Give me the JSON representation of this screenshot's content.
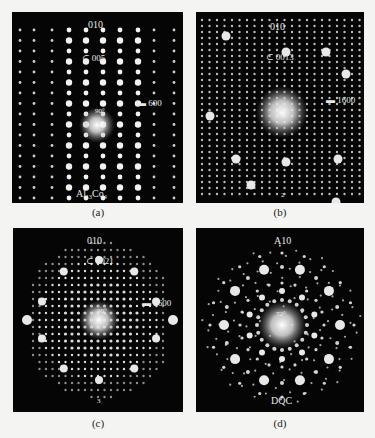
{
  "figure": {
    "panels": [
      {
        "id": "a",
        "caption": "(a)",
        "zone_axis": "010",
        "phase_label": "Al13Co4",
        "phase_main": "Al",
        "phase_sub1": "13",
        "phase_mid": "Co",
        "phase_sub2": "4",
        "reflection_top": "005",
        "reflection_right": "600",
        "angle_label": "90°",
        "pattern": "vertical-rows"
      },
      {
        "id": "b",
        "caption": "(b)",
        "zone_axis": "010",
        "reflection_top": "0013",
        "reflection_right": "1600",
        "angle_label": "90°",
        "bottom_mark": "2",
        "pattern": "dense-rectangular"
      },
      {
        "id": "c",
        "caption": "(c)",
        "zone_axis": "010",
        "reflection_top": "0021",
        "reflection_right": "2600",
        "angle_label": "90°",
        "bottom_mark": "3",
        "pattern": "pseudo-decagonal"
      },
      {
        "id": "d",
        "caption": "(d)",
        "zone_axis": "A10",
        "phase_label": "DQC",
        "angle_label": "72°",
        "pattern": "decagonal"
      }
    ],
    "colors": {
      "background": "#f4f4f2",
      "panel": "#050505",
      "spot": "#ffffff",
      "text_on_panel": "#e8e8e8"
    }
  }
}
